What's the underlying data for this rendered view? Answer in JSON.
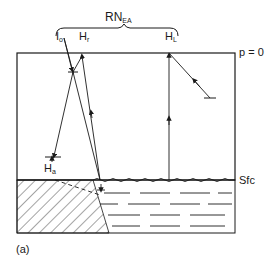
{
  "figure": {
    "panel_label": "(a)",
    "brace_label": {
      "main": "RN",
      "sub": "EA"
    },
    "top_level_label": "p = 0",
    "surface_label": "Sfc",
    "fluxes": [
      {
        "id": "incoming-solar",
        "main": "I",
        "sub": "o"
      },
      {
        "id": "reflected",
        "main": "H",
        "sub": "r"
      },
      {
        "id": "longwave",
        "main": "H",
        "sub": "L"
      },
      {
        "id": "absorbed",
        "main": "H",
        "sub": "a"
      }
    ]
  },
  "colors": {
    "ink": "#1a1a1a",
    "background": "#ffffff"
  }
}
